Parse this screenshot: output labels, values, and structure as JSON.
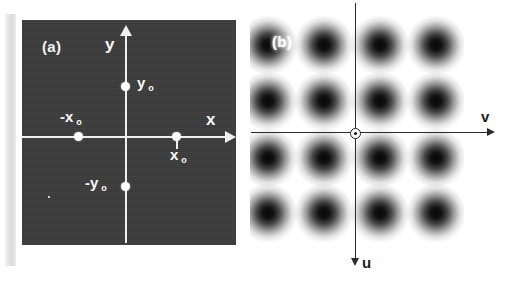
{
  "figure": {
    "panels": [
      {
        "id": "a",
        "label": "(a)",
        "type": "scatter",
        "background_color": "#3a3a3a",
        "mark_color": "#ffffff",
        "axes": {
          "x_label": "x",
          "y_label": "y",
          "x_direction": "right",
          "y_direction": "up",
          "origin_label": ""
        },
        "points": [
          {
            "name": "x-zero",
            "label": "x",
            "sub": "o",
            "display": "x o",
            "x": 1.0,
            "y": 0.0
          },
          {
            "name": "negative-x-zero",
            "label": "-x",
            "sub": "o",
            "display": "-x o",
            "x": -1.0,
            "y": 0.0
          },
          {
            "name": "y-zero",
            "label": "y",
            "sub": "o",
            "display": "y o",
            "x": 0.0,
            "y": 1.0
          },
          {
            "name": "negative-y-zero",
            "label": "-y",
            "sub": "o",
            "display": "-y o",
            "x": 0.0,
            "y": -1.0
          }
        ]
      },
      {
        "id": "b",
        "label": "(b)",
        "type": "heatmap",
        "background_color": "#ffffff",
        "blob_color": "#000000",
        "axes": {
          "v_label": "v",
          "u_label": "u",
          "v_direction": "right",
          "u_direction": "down"
        },
        "pattern": {
          "description": "Blurred periodic 4x4 array of dark intensity maxima (cosine-squared fringe product)",
          "columns": 4,
          "rows": 4,
          "period_px": 56,
          "blob_centers_x_px": [
            18,
            74,
            130,
            186
          ],
          "blob_centers_y_px": [
            33,
            89,
            146,
            201
          ]
        }
      }
    ]
  },
  "chart_data": [
    {
      "type": "scatter",
      "title": "(a)",
      "xlabel": "x",
      "ylabel": "y",
      "xlim": [
        -2.1,
        2.1
      ],
      "ylim": [
        -2.1,
        2.1
      ],
      "grid": false,
      "legend": "none",
      "point_labels": [
        "x o",
        "-x o",
        "y o",
        "-y o"
      ],
      "x": [
        1.0,
        -1.0,
        0.0,
        0.0
      ],
      "y": [
        0.0,
        0.0,
        1.0,
        -1.0
      ]
    },
    {
      "type": "heatmap",
      "title": "(b)",
      "xlabel": "v",
      "ylabel": "u",
      "grid": false,
      "legend": "none",
      "description": "Squared-cosine interference pattern; dark maxima on a square lattice",
      "lattice_columns": 4,
      "lattice_rows": 4,
      "period_px": 56
    }
  ]
}
